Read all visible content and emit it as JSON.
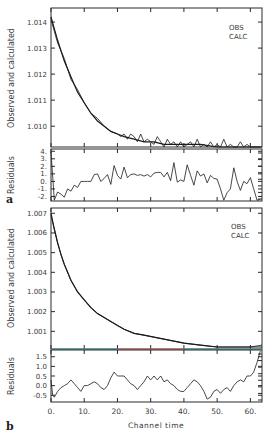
{
  "chart_data": [
    {
      "panel": "a",
      "type": "line",
      "ylabel": "Observed and calculated",
      "xlabel": "",
      "legend": [
        "OBS",
        "CALC"
      ],
      "legend_position": "upper-right",
      "ylim": [
        1.0092,
        1.01454
      ],
      "xlim": [
        0,
        63.5
      ],
      "yticks": [
        "1.010",
        "1.011",
        "1.012",
        "1.013",
        "1.014"
      ],
      "ytick_values": [
        1.01,
        1.011,
        1.012,
        1.013,
        1.014
      ],
      "grid": false,
      "series": [
        {
          "name": "CALC",
          "x": [
            0,
            2,
            4,
            6,
            8,
            10,
            12,
            14,
            16,
            18,
            20,
            22,
            25,
            28,
            31,
            34,
            37,
            40,
            45,
            50,
            55,
            60,
            63.5
          ],
          "values": [
            1.0142,
            1.0133,
            1.0125,
            1.0119,
            1.0113,
            1.0109,
            1.0105,
            1.0102,
            1.01,
            1.0098,
            1.0097,
            1.0096,
            1.0095,
            1.0094,
            1.0094,
            1.0093,
            1.0093,
            1.0093,
            1.0093,
            1.0092,
            1.0092,
            1.0092,
            1.0092
          ]
        },
        {
          "name": "OBS",
          "x": [
            0,
            2,
            4,
            6,
            8,
            10,
            12,
            14,
            16,
            18,
            20,
            21,
            22,
            23,
            24,
            25,
            26,
            27,
            28,
            29,
            30,
            31,
            32,
            33,
            34,
            35,
            36,
            37,
            38,
            39,
            40,
            41,
            42,
            43,
            44,
            45,
            46,
            47,
            48,
            49,
            50,
            51,
            52,
            53,
            54,
            55,
            56,
            57,
            58,
            59,
            60,
            61,
            62,
            63
          ],
          "values": [
            1.0141,
            1.0132,
            1.0126,
            1.0118,
            1.0114,
            1.0109,
            1.0105,
            1.0103,
            1.01,
            1.0098,
            1.0097,
            1.0096,
            1.0097,
            1.0095,
            1.0097,
            1.0096,
            1.0094,
            1.0097,
            1.0094,
            1.0095,
            1.0094,
            1.0093,
            1.0096,
            1.0094,
            1.0092,
            1.0095,
            1.0093,
            1.0094,
            1.0091,
            1.0094,
            1.0092,
            1.0093,
            1.0094,
            1.0091,
            1.0095,
            1.0092,
            1.0093,
            1.0092,
            1.0094,
            1.0091,
            1.0093,
            1.0092,
            1.0095,
            1.009,
            1.0093,
            1.0092,
            1.009,
            1.0094,
            1.0091,
            1.0093,
            1.0092,
            1.009,
            1.0092,
            1.0091
          ]
        }
      ]
    },
    {
      "panel": "a-residuals",
      "type": "line",
      "ylabel": "Residuals",
      "yticks": [
        "-2.",
        "-1.",
        "0.",
        "1.",
        "2.",
        "3.",
        "4."
      ],
      "ytick_values": [
        -2,
        -1,
        0,
        1,
        2,
        3,
        4
      ],
      "ylim": [
        -2.6,
        4.3
      ],
      "xlim": [
        0,
        63.5
      ],
      "series": [
        {
          "name": "Residuals",
          "x": [
            0,
            1,
            2,
            3,
            4,
            5,
            6,
            7,
            8,
            9,
            10,
            11,
            12,
            13,
            14,
            15,
            16,
            17,
            18,
            19,
            20,
            21,
            22,
            23,
            24,
            25,
            26,
            27,
            28,
            29,
            30,
            31,
            32,
            33,
            34,
            35,
            36,
            37,
            38,
            39,
            40,
            41,
            42,
            43,
            44,
            45,
            46,
            47,
            48,
            49,
            50,
            51,
            52,
            53,
            54,
            55,
            56,
            57,
            58,
            59,
            60,
            61,
            62,
            63
          ],
          "values": [
            3.9,
            -2.5,
            -1.4,
            -1.7,
            -2.1,
            -1.0,
            -1.3,
            -0.5,
            -0.8,
            0.0,
            0.0,
            0.0,
            0.0,
            0.9,
            1.0,
            0.0,
            0.4,
            0.9,
            -0.4,
            2.1,
            0.8,
            0.3,
            1.9,
            0.5,
            0.9,
            1.0,
            0.8,
            0.9,
            0.7,
            0.9,
            0.6,
            1.1,
            1.2,
            1.2,
            0.6,
            1.2,
            0.1,
            2.5,
            -0.1,
            0.2,
            0.0,
            2.2,
            0.8,
            -0.5,
            1.4,
            0.7,
            1.0,
            -0.2,
            0.8,
            0.4,
            0.3,
            -1.0,
            -2.5,
            -1.5,
            -1.0,
            1.8,
            0.0,
            -1.2,
            0.0,
            -0.3,
            0.5,
            -1.0,
            -2.5,
            -2.4
          ]
        }
      ]
    },
    {
      "panel": "b",
      "type": "line",
      "ylabel": "Observed and calculated",
      "xlabel": "",
      "legend": [
        "OBS",
        "CALC"
      ],
      "legend_position": "upper-right",
      "ylim": [
        1.0001,
        1.00727
      ],
      "xlim": [
        0,
        63.5
      ],
      "yticks": [
        "1.001",
        "1.002",
        "1.003",
        "1.004",
        "1.005",
        "1.006",
        "1.007"
      ],
      "ytick_values": [
        1.001,
        1.002,
        1.003,
        1.004,
        1.005,
        1.006,
        1.007
      ],
      "grid": false,
      "series": [
        {
          "name": "CALC",
          "x": [
            0,
            1,
            2,
            3,
            4,
            5,
            6,
            8,
            10,
            12,
            14,
            16,
            18,
            20,
            22,
            25,
            28,
            31,
            34,
            37,
            40,
            45,
            50,
            55,
            60,
            63.5
          ],
          "values": [
            1.007,
            1.0062,
            1.0055,
            1.0049,
            1.0044,
            1.004,
            1.0036,
            1.003,
            1.0026,
            1.0022,
            1.0019,
            1.0017,
            1.0015,
            1.0013,
            1.0011,
            1.0009,
            1.0008,
            1.0007,
            1.0006,
            1.0005,
            1.0004,
            1.0003,
            1.0002,
            1.0002,
            1.0002,
            1.0002
          ]
        },
        {
          "name": "OBS",
          "x": [
            0,
            1,
            2,
            3,
            4,
            5,
            6,
            8,
            10,
            12,
            14,
            16,
            18,
            20,
            22,
            25,
            28,
            31,
            34,
            37,
            40,
            45,
            50,
            55,
            60,
            63.5
          ],
          "values": [
            1.0069,
            1.0062,
            1.0055,
            1.0049,
            1.0044,
            1.004,
            1.0036,
            1.003,
            1.0026,
            1.0022,
            1.0019,
            1.0017,
            1.0015,
            1.0013,
            1.0011,
            1.0009,
            1.0008,
            1.0007,
            1.0006,
            1.0005,
            1.0004,
            1.0003,
            1.0002,
            1.0002,
            1.0002,
            1.0003
          ]
        }
      ]
    },
    {
      "panel": "b-residuals",
      "type": "line",
      "ylabel": "Residuals",
      "xlabel": "Channel time",
      "yticks": [
        "-0.5",
        "0.0",
        "0.5",
        "1.0",
        "1.5"
      ],
      "ytick_values": [
        -0.5,
        0.0,
        0.5,
        1.0,
        1.5
      ],
      "ylim": [
        -0.85,
        1.85
      ],
      "xlim": [
        0,
        63.5
      ],
      "xticks": [
        "0.",
        "10.",
        "20.",
        "30.",
        "40.",
        "50.",
        "60."
      ],
      "xtick_values": [
        0,
        10,
        20,
        30,
        40,
        50,
        60
      ],
      "series": [
        {
          "name": "Residuals",
          "x": [
            0,
            0.5,
            1,
            2,
            3,
            4,
            5,
            6,
            7,
            8,
            9,
            10,
            11,
            12,
            13,
            14,
            15,
            16,
            17,
            18,
            19,
            20,
            21,
            22,
            23,
            24,
            25,
            26,
            27,
            28,
            29,
            30,
            31,
            32,
            33,
            34,
            35,
            36,
            37,
            38,
            39,
            40,
            41,
            42,
            43,
            44,
            45,
            46,
            47,
            48,
            49,
            50,
            51,
            52,
            53,
            54,
            55,
            56,
            57,
            58,
            59,
            60,
            61,
            62,
            63
          ],
          "values": [
            0.3,
            -0.5,
            -0.6,
            -0.3,
            -0.1,
            0.0,
            0.1,
            0.3,
            0.1,
            -0.1,
            -0.3,
            0.0,
            0.0,
            0.1,
            0.2,
            0.1,
            -0.1,
            -0.2,
            0.0,
            0.4,
            0.7,
            0.5,
            0.5,
            0.5,
            0.3,
            0.1,
            0.0,
            -0.2,
            0.0,
            0.2,
            0.5,
            0.3,
            0.5,
            0.3,
            0.5,
            0.2,
            0.3,
            0.1,
            0.0,
            -0.2,
            -0.3,
            -0.3,
            -0.1,
            0.1,
            0.3,
            0.2,
            0.0,
            -0.3,
            -0.7,
            -0.6,
            -0.3,
            -0.2,
            -0.4,
            -0.2,
            -0.1,
            -0.3,
            0.0,
            0.2,
            0.3,
            0.2,
            0.5,
            0.5,
            0.7,
            1.2,
            1.8
          ]
        }
      ]
    }
  ],
  "labels": {
    "panel_a_letter": "a",
    "panel_b_letter": "b",
    "ylabel_main": "Observed and calculated",
    "ylabel_resid": "Residuals",
    "xlabel": "Channel time",
    "legend_obs": "OBS",
    "legend_calc": "CALC"
  },
  "colors": {
    "axis": "#2a2a2a",
    "line": "#1a1a1a",
    "text": "#3a3a3a",
    "zero_line_left": "#3aa0a0",
    "zero_line_mid": "#e06060",
    "zero_line_right": "#3aa0a0"
  }
}
